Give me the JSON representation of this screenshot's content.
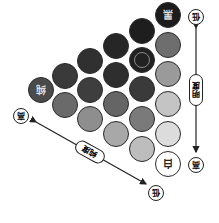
{
  "diagram": {
    "title": "",
    "orientation": "rotated-180",
    "corners": {
      "black": {
        "label": "黑",
        "color": "#1a1a1a"
      },
      "white": {
        "label": "白",
        "color": "#ffffff"
      },
      "pure": {
        "label": "纯",
        "color": "#3c3c3c"
      }
    },
    "axes": {
      "vertical": {
        "label": "明度",
        "end_top": "低",
        "end_bottom": "高"
      },
      "diagonal": {
        "label": "纯度",
        "end_left": "高",
        "end_right": "低"
      }
    },
    "circles": [
      {
        "col": 6,
        "cx": 168,
        "cy": 15,
        "color": "#1c1c1c",
        "label": "黑"
      },
      {
        "col": 6,
        "cx": 168,
        "cy": 45,
        "color": "#6e6e6e"
      },
      {
        "col": 6,
        "cx": 168,
        "cy": 74,
        "color": "#9a9a9a"
      },
      {
        "col": 6,
        "cx": 168,
        "cy": 104,
        "color": "#c4c4c4"
      },
      {
        "col": 6,
        "cx": 168,
        "cy": 134,
        "color": "#dcdcdc"
      },
      {
        "col": 6,
        "cx": 168,
        "cy": 164,
        "color": "#ffffff",
        "label": "白"
      },
      {
        "col": 5,
        "cx": 142,
        "cy": 31,
        "color": "#1e1e1e"
      },
      {
        "col": 5,
        "cx": 142,
        "cy": 60,
        "color": "#222222",
        "ring": true
      },
      {
        "col": 5,
        "cx": 142,
        "cy": 89,
        "color": "#3a3a3a"
      },
      {
        "col": 5,
        "cx": 142,
        "cy": 119,
        "color": "#7a7a7a"
      },
      {
        "col": 5,
        "cx": 142,
        "cy": 149,
        "color": "#bdbdbd"
      },
      {
        "col": 4,
        "cx": 116,
        "cy": 46,
        "color": "#262626"
      },
      {
        "col": 4,
        "cx": 116,
        "cy": 75,
        "color": "#2e2e2e"
      },
      {
        "col": 4,
        "cx": 116,
        "cy": 104,
        "color": "#656565"
      },
      {
        "col": 4,
        "cx": 116,
        "cy": 134,
        "color": "#a8a8a8"
      },
      {
        "col": 3,
        "cx": 90,
        "cy": 61,
        "color": "#303030"
      },
      {
        "col": 3,
        "cx": 90,
        "cy": 90,
        "color": "#3e3e3e"
      },
      {
        "col": 3,
        "cx": 90,
        "cy": 119,
        "color": "#8e8e8e"
      },
      {
        "col": 2,
        "cx": 65,
        "cy": 76,
        "color": "#3a3a3a"
      },
      {
        "col": 2,
        "cx": 65,
        "cy": 105,
        "color": "#6a6a6a"
      },
      {
        "col": 1,
        "cx": 41,
        "cy": 90,
        "color": "#4a4a4a",
        "label": "纯"
      }
    ]
  }
}
